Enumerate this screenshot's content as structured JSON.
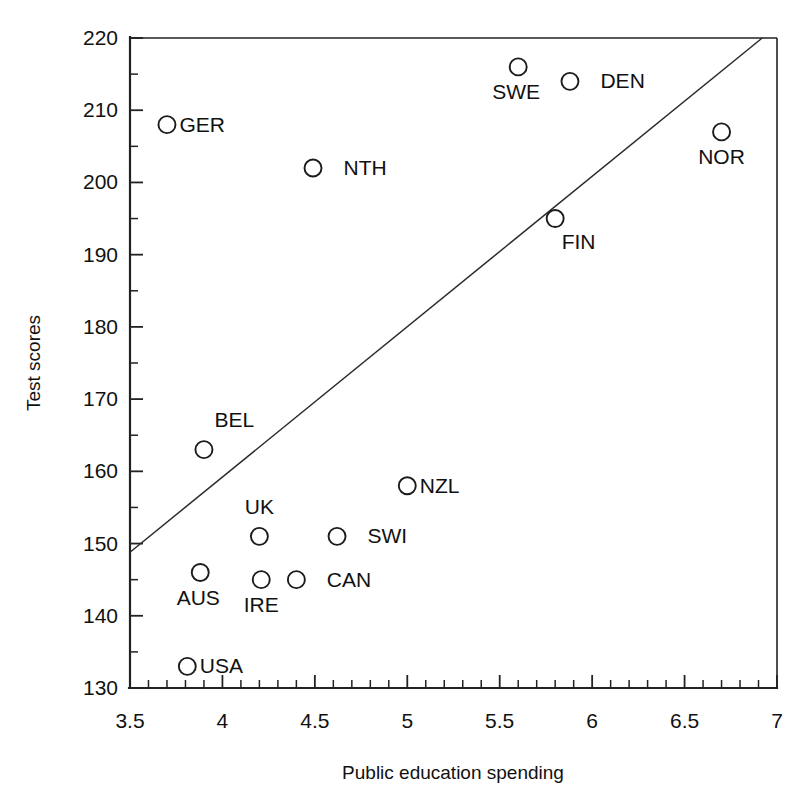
{
  "chart_data": {
    "type": "scatter",
    "title": "",
    "xlabel": "Public education spending",
    "ylabel": "Test scores",
    "xlim": [
      3.5,
      7
    ],
    "ylim": [
      130,
      220
    ],
    "xticks": [
      3.5,
      4,
      4.5,
      5,
      5.5,
      6,
      6.5,
      7
    ],
    "xtick_labels": [
      "3.5",
      "4",
      "4.5",
      "5",
      "5.5",
      "6",
      "6.5",
      "7"
    ],
    "yticks": [
      130,
      140,
      150,
      160,
      170,
      180,
      190,
      200,
      210,
      220
    ],
    "ytick_labels": [
      "130",
      "140",
      "150",
      "160",
      "170",
      "180",
      "190",
      "200",
      "210",
      "220"
    ],
    "x_minor_step": 0.1,
    "y_minor_step": 5,
    "grid": false,
    "legend": null,
    "marker_style": "open-circle",
    "points": [
      {
        "label": "GER",
        "x": 3.7,
        "y": 208,
        "label_pos": "right"
      },
      {
        "label": "NTH",
        "x": 4.49,
        "y": 202,
        "label_pos": "right-far"
      },
      {
        "label": "SWE",
        "x": 5.6,
        "y": 216,
        "label_pos": "below-left"
      },
      {
        "label": "DEN",
        "x": 5.88,
        "y": 214,
        "label_pos": "right-far"
      },
      {
        "label": "NOR",
        "x": 6.7,
        "y": 207,
        "label_pos": "below"
      },
      {
        "label": "FIN",
        "x": 5.8,
        "y": 195,
        "label_pos": "below-right"
      },
      {
        "label": "BEL",
        "x": 3.9,
        "y": 163,
        "label_pos": "above-right"
      },
      {
        "label": "NZL",
        "x": 5.0,
        "y": 158,
        "label_pos": "right"
      },
      {
        "label": "UK",
        "x": 4.2,
        "y": 151,
        "label_pos": "above"
      },
      {
        "label": "SWI",
        "x": 4.62,
        "y": 151,
        "label_pos": "right-far"
      },
      {
        "label": "AUS",
        "x": 3.88,
        "y": 146,
        "label_pos": "below-left"
      },
      {
        "label": "IRE",
        "x": 4.21,
        "y": 145,
        "label_pos": "below"
      },
      {
        "label": "CAN",
        "x": 4.4,
        "y": 145,
        "label_pos": "right-far"
      },
      {
        "label": "USA",
        "x": 3.81,
        "y": 133,
        "label_pos": "right"
      }
    ],
    "trendline": {
      "name": "regression-line",
      "x0": 3.5,
      "y0": 148.8,
      "x1": 6.92,
      "y1": 220
    }
  }
}
